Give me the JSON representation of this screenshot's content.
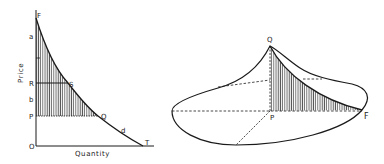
{
  "left_diagram": {
    "axis_labels": {
      "y": "Price",
      "x": "Quantity"
    },
    "point_labels": {
      "F": "F",
      "a": "a",
      "R": "R",
      "S": "S",
      "b": "b",
      "P": "P",
      "Q": "Q",
      "d": "d",
      "T": "T",
      "O": "O"
    },
    "description": "Demand curve d from F to T with consumer surplus regions a (above RS) and b (between RS and PQ) hatched"
  },
  "right_diagram": {
    "point_labels": {
      "Q": "Q",
      "P": "P",
      "F": "F"
    },
    "description": "3D solid of revolution with apex Q over base point P; hatched cross-section triangle Q-P-F"
  },
  "colors": {
    "ink": "#1a1a1a",
    "hatch": "#555555",
    "background": "#ffffff"
  }
}
